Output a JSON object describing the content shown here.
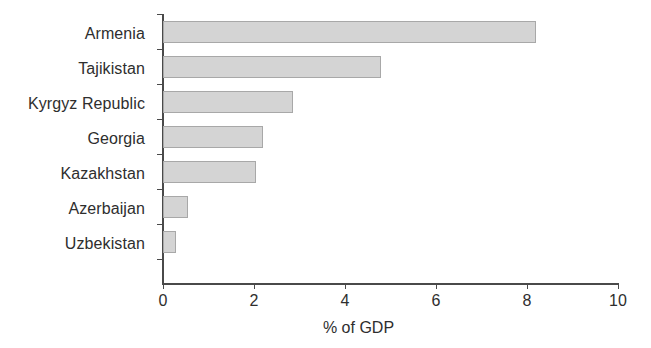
{
  "chart_data": {
    "type": "bar",
    "orientation": "horizontal",
    "title": "",
    "xlabel": "% of GDP",
    "ylabel": "",
    "categories": [
      "Armenia",
      "Tajikistan",
      "Kyrgyz Republic",
      "Georgia",
      "Kazakhstan",
      "Azerbaijan",
      "Uzbekistan"
    ],
    "values": [
      8.2,
      4.8,
      2.85,
      2.2,
      2.05,
      0.55,
      0.28
    ],
    "xlim": [
      0,
      10
    ],
    "xticks": [
      0,
      2,
      4,
      6,
      8,
      10
    ],
    "xtick_labels": [
      "0",
      "2",
      "4",
      "6",
      "8",
      "10"
    ],
    "grid": false,
    "legend": null,
    "bar_color": "#d4d4d4",
    "bar_border_color": "#a8a8a8",
    "axis_color": "#4a4a4a"
  }
}
